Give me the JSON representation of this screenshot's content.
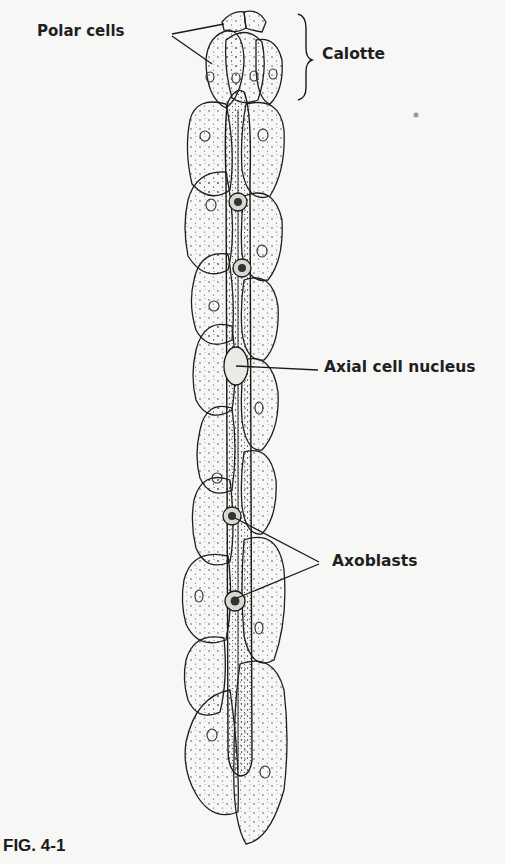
{
  "figure": {
    "caption": "FIG. 4-1",
    "labels": {
      "polar_cells": "Polar cells",
      "calotte": "Calotte",
      "axial_cell_nucleus": "Axial cell nucleus",
      "axoblasts": "Axoblasts"
    },
    "colors": {
      "background": "#f7f7f5",
      "ink": "#1a1a1a"
    }
  }
}
